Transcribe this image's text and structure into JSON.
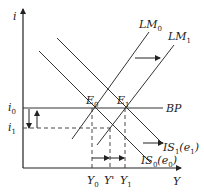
{
  "diagram": {
    "type": "IS-LM-BP",
    "axes": {
      "y_label": "i",
      "x_label": "Y"
    },
    "curves": {
      "lm0": {
        "base": "LM",
        "sub": "0"
      },
      "lm1": {
        "base": "LM",
        "sub": "1"
      },
      "bp": {
        "base": "BP",
        "sub": ""
      },
      "is1": {
        "base": "IS",
        "sub": "1",
        "arg_base": "e",
        "arg_sub": "1"
      },
      "is0": {
        "base": "IS",
        "sub": "0",
        "arg_base": "e",
        "arg_sub": "0"
      }
    },
    "points": {
      "e0": {
        "base": "E",
        "sub": "0"
      },
      "e1": {
        "base": "E",
        "sub": "1"
      }
    },
    "y_ticks": {
      "i0": {
        "base": "i",
        "sub": "0"
      },
      "i1": {
        "base": "i",
        "sub": "1"
      }
    },
    "x_ticks": {
      "y0": {
        "base": "Y",
        "sub": "0"
      },
      "yprime": {
        "base": "Y'",
        "sub": ""
      },
      "y1": {
        "base": "Y",
        "sub": "1"
      }
    },
    "colors": {
      "line": "#333333",
      "background": "#ffffff"
    }
  }
}
